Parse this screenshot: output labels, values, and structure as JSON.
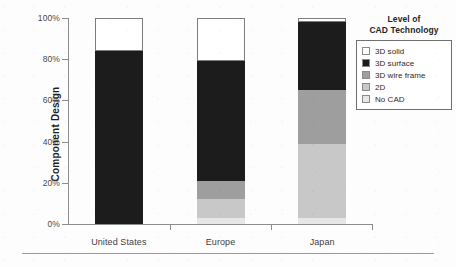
{
  "chart_data": {
    "type": "bar",
    "variant": "stacked-100-percent",
    "title": "",
    "xlabel": "",
    "ylabel": "Component Design",
    "ylim": [
      0,
      100
    ],
    "yticks": [
      "0%",
      "20%",
      "40%",
      "60%",
      "80%",
      "100%"
    ],
    "ytick_values": [
      0,
      20,
      40,
      60,
      80,
      100
    ],
    "grid": false,
    "legend_position": "right",
    "legend_title": "Level of CAD Technology",
    "categories": [
      "United States",
      "Europe",
      "Japan"
    ],
    "series": [
      {
        "name": "3D solid",
        "color": "#ffffff",
        "outlined": true,
        "values": [
          16,
          21,
          2
        ]
      },
      {
        "name": "3D surface",
        "color": "#1c1c1c",
        "outlined": false,
        "values": [
          84,
          58,
          33
        ]
      },
      {
        "name": "3D wire frame",
        "color": "#9e9e9e",
        "outlined": false,
        "values": [
          0,
          9,
          26
        ]
      },
      {
        "name": "2D",
        "color": "#c8c8c8",
        "outlined": false,
        "values": [
          0,
          9,
          36
        ]
      },
      {
        "name": "No CAD",
        "color": "#e6e6e6",
        "outlined": false,
        "values": [
          0,
          3,
          3
        ]
      }
    ],
    "stack_order_bottom_to_top": [
      "No CAD",
      "2D",
      "3D wire frame",
      "3D surface",
      "3D solid"
    ]
  },
  "axis": {
    "y_title": "Component Design",
    "ticks": [
      {
        "label": "100%",
        "value": 100
      },
      {
        "label": "80%",
        "value": 80
      },
      {
        "label": "60%",
        "value": 60
      },
      {
        "label": "40%",
        "value": 40
      },
      {
        "label": "20%",
        "value": 20
      },
      {
        "label": "0%",
        "value": 0
      }
    ]
  },
  "legend": {
    "title_line1": "Level of",
    "title_line2": "CAD Technology",
    "items": [
      {
        "label": "3D solid",
        "swatch": "swatch-3d-solid"
      },
      {
        "label": "3D surface",
        "swatch": "swatch-3d-surface"
      },
      {
        "label": "3D wire frame",
        "swatch": "swatch-3d-wire-frame"
      },
      {
        "label": "2D",
        "swatch": "swatch-2d"
      },
      {
        "label": "No CAD",
        "swatch": "swatch-no-cad"
      }
    ]
  },
  "x_categories": [
    {
      "label": "United States"
    },
    {
      "label": "Europe"
    },
    {
      "label": "Japan"
    }
  ]
}
